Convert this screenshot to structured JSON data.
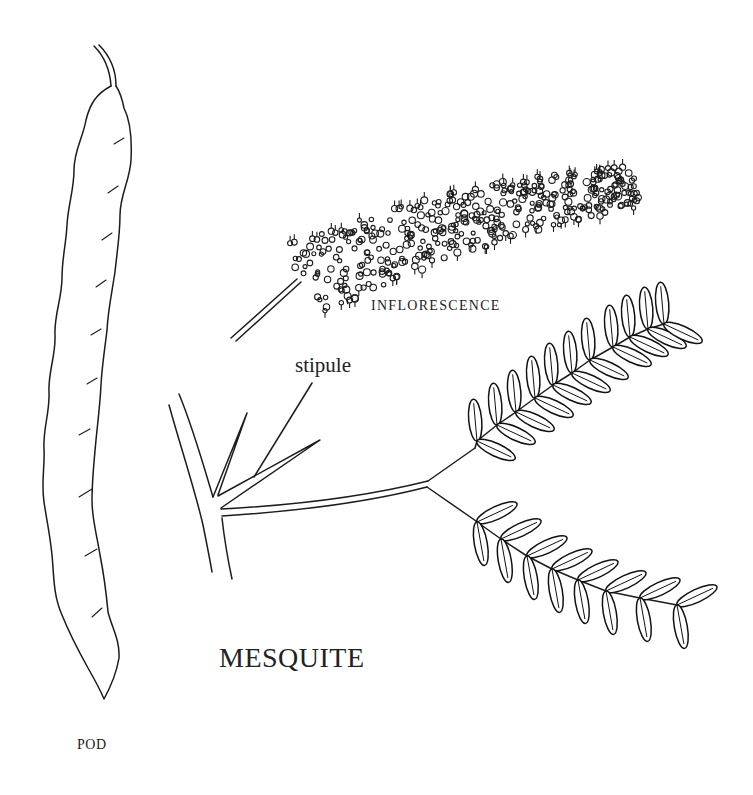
{
  "title": "MESQUITE",
  "labels": {
    "inflorescence": "INFLORESCENCE",
    "stipule": "stipule",
    "pod": "POD"
  },
  "parts": [
    {
      "id": "pod",
      "description": "long narrow wavy seed pod"
    },
    {
      "id": "inflorescence",
      "description": "elongated spike of tiny flowers on a stalk"
    },
    {
      "id": "twig",
      "description": "branch with leaf stalk and two spine-like stipules"
    },
    {
      "id": "upper-pinna",
      "description": "pinnate leaf branch",
      "leaflet_pairs": 11
    },
    {
      "id": "lower-pinna",
      "description": "pinnate leaf branch",
      "leaflet_pairs": 9
    }
  ],
  "colors": {
    "ink": "#1c1c1c",
    "background": "#ffffff"
  }
}
